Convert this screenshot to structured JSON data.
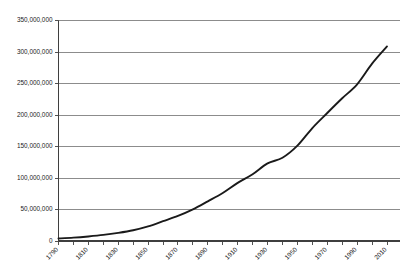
{
  "chart_data": {
    "type": "line",
    "title": "",
    "xlabel": "",
    "ylabel": "",
    "xlim": [
      1790,
      2010
    ],
    "ylim": [
      0,
      350000000
    ],
    "grid": true,
    "legend_position": "none",
    "series_color": "#1a1a1a",
    "gridline_color": "#7f7f7f",
    "axis_color": "#3f3f3f",
    "background_color": "#ffffff",
    "y_ticks": [
      0,
      50000000,
      100000000,
      150000000,
      200000000,
      250000000,
      300000000,
      350000000
    ],
    "y_tick_labels": [
      "0",
      "50,000,000",
      "100,000,000",
      "150,000,000",
      "200,000,000",
      "250,000,000",
      "300,000,000",
      "350,000,000"
    ],
    "x_ticks": [
      1790,
      1800,
      1810,
      1820,
      1830,
      1840,
      1850,
      1860,
      1870,
      1880,
      1890,
      1900,
      1910,
      1920,
      1930,
      1940,
      1950,
      1960,
      1970,
      1980,
      1990,
      2000,
      2010
    ],
    "x_tick_labels": [
      "1790",
      "",
      "1810",
      "",
      "1830",
      "",
      "1850",
      "",
      "1870",
      "",
      "1890",
      "",
      "1910",
      "",
      "1930",
      "",
      "1950",
      "",
      "1970",
      "",
      "1990",
      "",
      "2010"
    ],
    "x_label_rotation": -45,
    "categories": [
      1790,
      1800,
      1810,
      1820,
      1830,
      1840,
      1850,
      1860,
      1870,
      1880,
      1890,
      1900,
      1910,
      1920,
      1930,
      1940,
      1950,
      1960,
      1970,
      1980,
      1990,
      2000,
      2010
    ],
    "values": [
      3929214,
      5308483,
      7239881,
      9638453,
      12866020,
      17069453,
      23191876,
      31443321,
      39818449,
      50189209,
      62979766,
      76212168,
      92228496,
      106021537,
      123202624,
      132164569,
      151325798,
      179323175,
      203211926,
      226545805,
      248709873,
      281421906,
      308745538
    ],
    "series": [
      {
        "name": "Population",
        "values": [
          3929214,
          5308483,
          7239881,
          9638453,
          12866020,
          17069453,
          23191876,
          31443321,
          39818449,
          50189209,
          62979766,
          76212168,
          92228496,
          106021537,
          123202624,
          132164569,
          151325798,
          179323175,
          203211926,
          226545805,
          248709873,
          281421906,
          308745538
        ]
      }
    ]
  }
}
